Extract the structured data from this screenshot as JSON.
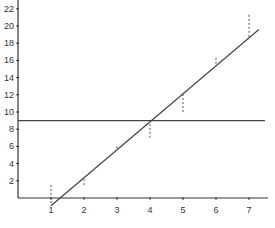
{
  "chart_data": {
    "type": "scatter",
    "title": "",
    "xlabel": "",
    "ylabel": "",
    "x_ticks": [
      1,
      2,
      3,
      4,
      5,
      6,
      7
    ],
    "y_ticks": [
      2,
      4,
      6,
      8,
      10,
      12,
      14,
      16,
      18,
      20,
      22
    ],
    "xlim": [
      0,
      7.5
    ],
    "ylim": [
      -1,
      23
    ],
    "grid": false,
    "series": [
      {
        "name": "observations",
        "x": [
          1,
          2,
          3,
          4,
          5,
          6,
          7
        ],
        "y": [
          1.5,
          1.5,
          6,
          7,
          10,
          16.3,
          21.3
        ]
      }
    ],
    "regression_line": {
      "x_start": 1,
      "y_start": -0.9,
      "x_end": 7.3,
      "y_end": 19.6,
      "slope": 3.25,
      "intercept": -4.15
    },
    "mean_line": {
      "y": 9
    },
    "residuals_style": "dashed vertical lines from each observation to the regression line"
  },
  "colors": {
    "axis": "#333333",
    "line": "#444444",
    "residual": "#555555",
    "background": "#ffffff"
  }
}
